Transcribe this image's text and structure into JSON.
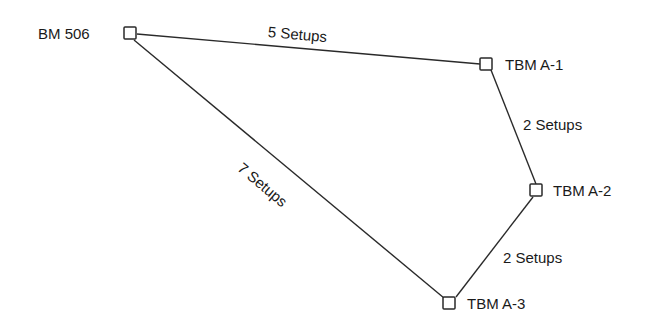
{
  "diagram": {
    "type": "level-loop-traverse",
    "nodes": [
      {
        "id": "bm506",
        "label": "BM 506",
        "x": 130,
        "y": 33
      },
      {
        "id": "tbma1",
        "label": "TBM A-1",
        "x": 486,
        "y": 64
      },
      {
        "id": "tbma2",
        "label": "TBM A-2",
        "x": 536,
        "y": 190
      },
      {
        "id": "tbma3",
        "label": "TBM A-3",
        "x": 449,
        "y": 303
      }
    ],
    "edges": [
      {
        "from": "bm506",
        "to": "tbma1",
        "label": "5 Setups"
      },
      {
        "from": "tbma1",
        "to": "tbma2",
        "label": "2 Setups"
      },
      {
        "from": "tbma2",
        "to": "tbma3",
        "label": "2 Setups"
      },
      {
        "from": "tbma3",
        "to": "bm506",
        "label": "7 Setups"
      }
    ],
    "colors": {
      "line": "#2a2a2a",
      "background": "#ffffff"
    }
  }
}
